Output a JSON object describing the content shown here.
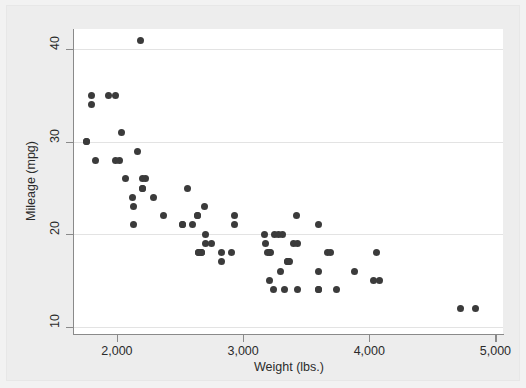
{
  "chart_data": {
    "type": "scatter",
    "title": "",
    "xlabel": "Weight (lbs.)",
    "ylabel": "Mileage (mpg)",
    "xlim": [
      1660,
      5060
    ],
    "ylim": [
      9.2,
      42.2
    ],
    "xticks": [
      2000,
      3000,
      4000,
      5000
    ],
    "xticklabels": [
      "2,000",
      "3,000",
      "4,000",
      "5,000"
    ],
    "yticks": [
      10,
      20,
      30,
      40
    ],
    "yticklabels": [
      "10",
      "20",
      "30",
      "40"
    ],
    "grid": "horizontal",
    "legend": "none",
    "marker": {
      "shape": "circle",
      "color": "#3b3b3b",
      "size_px": 7
    },
    "n_points": 74,
    "x": [
      2930,
      3350,
      2640,
      3250,
      4080,
      3670,
      2230,
      3280,
      3880,
      3400,
      3330,
      3600,
      3600,
      3740,
      4840,
      4720,
      3430,
      3210,
      4060,
      3600,
      3350,
      2700,
      2690,
      3690,
      3180,
      3220,
      2750,
      3430,
      2120,
      2670,
      2595,
      2700,
      2556,
      2200,
      2020,
      2130,
      1800,
      1990,
      3600,
      3300,
      2830,
      2200,
      2520,
      2650,
      1760,
      4030,
      3210,
      3360,
      2290,
      2640,
      3420,
      3195,
      3310,
      2200,
      2520,
      2830,
      3170,
      2160,
      2040,
      1930,
      1990,
      3240,
      3370,
      2190,
      2670,
      2370,
      2130,
      2650,
      1800,
      1760,
      1830,
      2070,
      2910,
      2930
    ],
    "y": [
      22,
      17,
      22,
      20,
      15,
      18,
      26,
      20,
      16,
      19,
      14,
      14,
      21,
      14,
      12,
      12,
      14,
      15,
      18,
      14,
      17,
      19,
      23,
      18,
      19,
      18,
      19,
      19,
      24,
      18,
      21,
      20,
      25,
      25,
      28,
      21,
      35,
      28,
      16,
      16,
      18,
      25,
      21,
      18,
      30,
      15,
      18,
      17,
      24,
      22,
      22,
      18,
      20,
      26,
      21,
      17,
      20,
      29,
      31,
      35,
      35,
      14,
      17,
      41,
      18,
      22,
      23,
      18,
      34,
      30,
      28,
      26,
      18,
      21
    ],
    "data_source_note": ""
  },
  "axes": {
    "y_title": "Mileage (mpg)",
    "x_title": "Weight (lbs.)",
    "y_tick_labels": [
      "40",
      "30",
      "20",
      "10"
    ],
    "x_tick_labels": [
      "2,000",
      "3,000",
      "4,000",
      "5,000"
    ]
  },
  "colors": {
    "marker": "#3b3b3b",
    "gridline": "#e3e3e3",
    "axis": "#8a8a8a",
    "plot_bg": "#ffffff",
    "canvas_bg": "#ededed",
    "text": "#2b2b2b"
  }
}
